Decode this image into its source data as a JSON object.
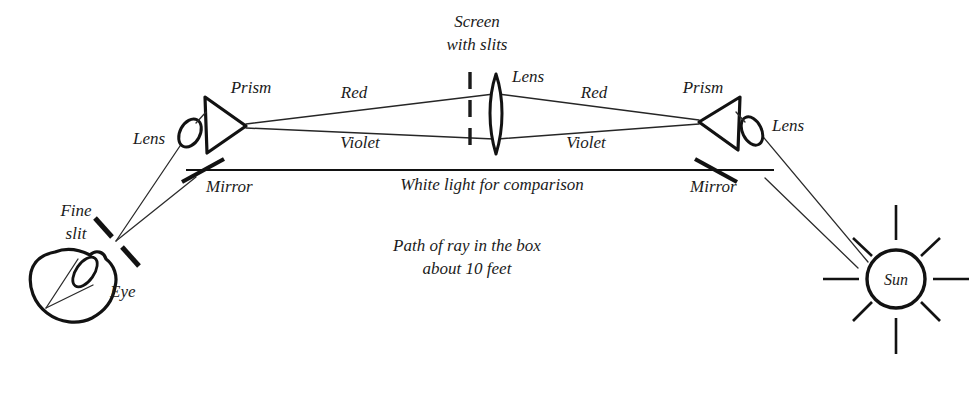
{
  "diagram": {
    "background_color": "#ffffff",
    "ink_color": "#1c1c1c",
    "labels": {
      "screen_line1": "Screen",
      "screen_line2": "with slits",
      "lens_center": "Lens",
      "lens_left": "Lens",
      "lens_right": "Lens",
      "prism_left": "Prism",
      "prism_right": "Prism",
      "red_left": "Red",
      "red_right": "Red",
      "violet_left": "Violet",
      "violet_right": "Violet",
      "mirror_left": "Mirror",
      "mirror_right": "Mirror",
      "white_light": "White light for comparison",
      "path_line1": "Path of ray in the box",
      "path_line2": "about 10 feet",
      "fine_slit_line1": "Fine",
      "fine_slit_line2": "slit",
      "eye": "Eye",
      "sun": "Sun"
    }
  }
}
